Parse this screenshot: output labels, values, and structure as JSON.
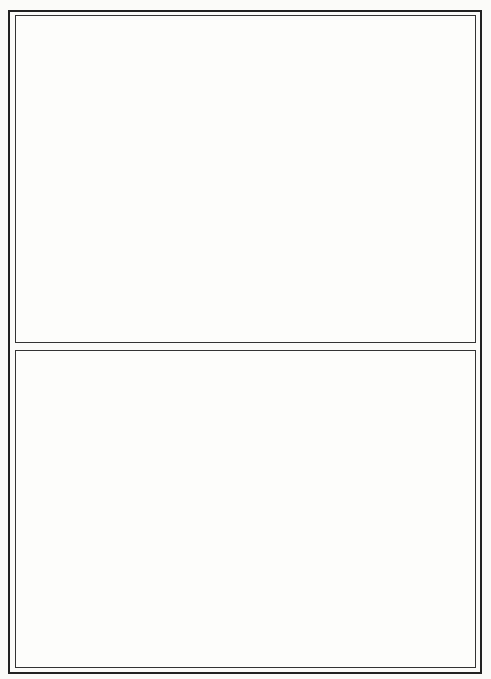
{
  "figure": {
    "panels": [
      {
        "id": "top",
        "description": "Southwestern United States map with open circles (absent/low) and filled circles (present), large filled circles with arrows in Texas/Colorado region",
        "state_lines": [
          "M 60 135 L 205 150 L 205 155",
          "M 213 150 L 213 280",
          "M 213 285 L 300 285",
          "M 213 150 L 300 155",
          "M 300 155 L 300 230",
          "M 200 230 L 423 233",
          "M 300 230 L 300 320",
          "M 150 290 L 185 318 L 215 318",
          "M 215 318 L 290 320",
          "M 60 135 L 60 75",
          "M 190 55 L 190 75 L 60 75",
          "M 117 53 L 117 60",
          "M 214 75 L 305 75",
          "M 305 75 L 305 150",
          "M 305 150 L 360 150",
          "M 360 150 L 362 220 L 360 225",
          "M 360 150 L 365 75 L 380 70",
          "M 375 110 L 365 110 L 363 205",
          "M 75 110 L 145 170 L 145 180"
        ],
        "open_circles": [
          [
            42,
            68
          ],
          [
            60,
            80
          ],
          [
            39,
            89
          ],
          [
            74,
            65
          ],
          [
            45,
            108
          ],
          [
            66,
            105
          ],
          [
            76,
            123
          ],
          [
            88,
            124
          ],
          [
            55,
            150
          ],
          [
            102,
            152
          ],
          [
            119,
            156
          ],
          [
            132,
            149
          ],
          [
            127,
            168
          ],
          [
            95,
            186
          ],
          [
            112,
            198
          ],
          [
            112,
            210
          ],
          [
            135,
            191
          ],
          [
            115,
            223
          ],
          [
            176,
            132
          ],
          [
            172,
            150
          ],
          [
            174,
            160
          ],
          [
            222,
            135
          ],
          [
            30,
            95
          ]
        ],
        "small_filled_dots": [
          [
            39,
            101
          ],
          [
            92,
            151
          ],
          [
            148,
            113
          ],
          [
            181,
            89
          ],
          [
            186,
            104
          ],
          [
            204,
            150
          ],
          [
            187,
            168
          ],
          [
            176,
            180
          ]
        ],
        "medium_filled_circles": [
          {
            "cx": 199,
            "cy": 291,
            "r": 6
          },
          {
            "cx": 191,
            "cy": 231,
            "r": 5
          },
          {
            "cx": 207,
            "cy": 231,
            "r": 5
          }
        ],
        "large_filled_circles": [
          {
            "cx": 218,
            "cy": 125,
            "r": 10
          },
          {
            "cx": 238,
            "cy": 122,
            "r": 12
          },
          {
            "cx": 255,
            "cy": 142,
            "r": 11
          },
          {
            "cx": 243,
            "cy": 208,
            "r": 14
          },
          {
            "cx": 316,
            "cy": 47,
            "r": 26
          },
          {
            "cx": 431,
            "cy": 81,
            "r": 40
          },
          {
            "cx": 424,
            "cy": 112,
            "r": 39
          },
          {
            "cx": 419,
            "cy": 145,
            "r": 40
          },
          {
            "cx": 325,
            "cy": 302,
            "r": 37
          }
        ],
        "arrows": [
          {
            "from": [
              296,
              64
            ],
            "to": [
              258,
              92
            ]
          },
          {
            "from": [
              398,
              183
            ],
            "to": [
              322,
              203
            ]
          },
          {
            "from": [
              386,
              112
            ],
            "to": [
              371,
              236
            ]
          },
          {
            "from": [
              412,
              187
            ],
            "to": [
              362,
              266
            ]
          },
          {
            "from": [
              304,
              270
            ],
            "to": [
              285,
              248
            ]
          }
        ]
      },
      {
        "id": "bottom",
        "description": "Enlarged detail map: California (left) and Texas/Oklahoma region (right) with filled circles of varying sizes",
        "filled_circles": [
          {
            "cx": 104,
            "cy": 361,
            "r": 7
          },
          {
            "cx": 55,
            "cy": 397,
            "r": 5
          },
          {
            "cx": 68,
            "cy": 409,
            "r": 5
          },
          {
            "cx": 61,
            "cy": 419,
            "r": 6
          },
          {
            "cx": 116,
            "cy": 408,
            "r": 10
          },
          {
            "cx": 132,
            "cy": 440,
            "r": 9
          },
          {
            "cx": 89,
            "cy": 493,
            "r": 8
          },
          {
            "cx": 155,
            "cy": 493,
            "r": 6
          },
          {
            "cx": 171,
            "cy": 491,
            "r": 8
          },
          {
            "cx": 205,
            "cy": 595,
            "r": 7
          },
          {
            "cx": 337,
            "cy": 459,
            "r": 3
          },
          {
            "cx": 433,
            "cy": 472,
            "r": 2.5
          },
          {
            "cx": 328,
            "cy": 500,
            "r": 2.5
          },
          {
            "cx": 393,
            "cy": 499,
            "r": 1.5
          },
          {
            "cx": 332,
            "cy": 521,
            "r": 1.5
          },
          {
            "cx": 353,
            "cy": 544,
            "r": 3
          },
          {
            "cx": 321,
            "cy": 567,
            "r": 3
          },
          {
            "cx": 408,
            "cy": 611,
            "r": 2.5
          },
          {
            "cx": 401,
            "cy": 652,
            "r": 8
          },
          {
            "cx": 370,
            "cy": 661,
            "r": 3
          }
        ]
      }
    ]
  }
}
